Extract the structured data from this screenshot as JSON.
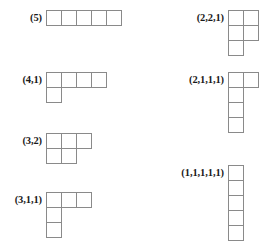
{
  "figure": {
    "cell_size_px": 16,
    "cell_border_color": "#8a8a8a",
    "label_color": "#1a1a1a",
    "background_color": "#ffffff"
  },
  "partitions": [
    {
      "id": "partition-5",
      "label": "(5)",
      "parts": [
        5
      ],
      "column": "left",
      "x": 0,
      "y": 10,
      "label_width": 42
    },
    {
      "id": "partition-4-1",
      "label": "(4,1)",
      "parts": [
        4,
        1
      ],
      "column": "left",
      "x": 0,
      "y": 72,
      "label_width": 42
    },
    {
      "id": "partition-3-2",
      "label": "(3,2)",
      "parts": [
        3,
        2
      ],
      "column": "left",
      "x": 0,
      "y": 133,
      "label_width": 42
    },
    {
      "id": "partition-3-1-1",
      "label": "(3,1,1)",
      "parts": [
        3,
        1,
        1
      ],
      "column": "left",
      "x": 0,
      "y": 192,
      "label_width": 42
    },
    {
      "id": "partition-2-2-1",
      "label": "(2,2,1)",
      "parts": [
        2,
        2,
        1
      ],
      "column": "right",
      "x": 0,
      "y": 10,
      "label_width": 94
    },
    {
      "id": "partition-2-1-1-1",
      "label": "(2,1,1,1)",
      "parts": [
        2,
        1,
        1,
        1
      ],
      "column": "right",
      "x": 0,
      "y": 72,
      "label_width": 94
    },
    {
      "id": "partition-1-1-1-1-1",
      "label": "(1,1,1,1,1)",
      "parts": [
        1,
        1,
        1,
        1,
        1
      ],
      "column": "right",
      "x": 0,
      "y": 165,
      "label_width": 94
    }
  ]
}
